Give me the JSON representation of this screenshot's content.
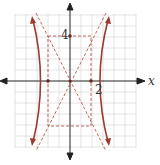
{
  "figure": {
    "type": "hyperbola graph",
    "equation_implied": "x^2/4 - y^2/16 = 1",
    "axis_labels": {
      "x": "x"
    },
    "tick_labels": {
      "x_vertex": "2",
      "y_co_vertex": "4"
    },
    "vertices": [
      [
        -2,
        0
      ],
      [
        2,
        0
      ]
    ],
    "co_vertices": [
      [
        0,
        4
      ],
      [
        0,
        -4
      ]
    ],
    "asymptotes": [
      "y = 2x",
      "y = -2x"
    ],
    "box": {
      "x": [
        -2,
        2
      ],
      "y": [
        -4,
        4
      ]
    },
    "colors": {
      "curve": "#9b3a2e",
      "dashed": "#b5584a",
      "grid": "#cccccc",
      "axis": "#222222"
    }
  }
}
